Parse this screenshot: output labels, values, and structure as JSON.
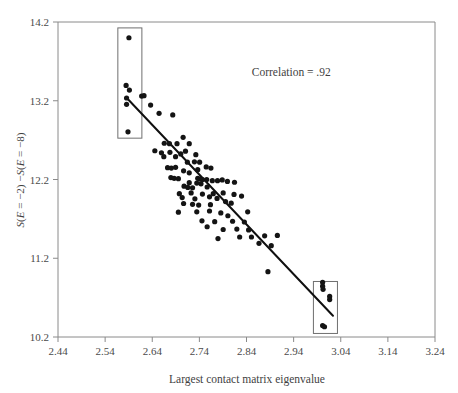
{
  "chart_data": {
    "type": "scatter",
    "title": "",
    "xlabel": "Largest contact matrix eigenvalue",
    "ylabel": "S(E = −2) −S(E = −8)",
    "ylabel_parts": {
      "p1": "S",
      "p2": "(",
      "p3": "E",
      "p4": " = −2) −",
      "p5": "S",
      "p6": "(",
      "p7": "E",
      "p8": " = −8)"
    },
    "xlim": [
      2.44,
      3.24
    ],
    "ylim": [
      10.2,
      14.2
    ],
    "xticks": [
      "2.44",
      "2.54",
      "2.64",
      "2.74",
      "2.84",
      "2.94",
      "3.04",
      "3.14",
      "3.24"
    ],
    "xtick_values": [
      2.44,
      2.54,
      2.64,
      2.74,
      2.84,
      2.94,
      3.04,
      3.14,
      3.24
    ],
    "yticks": [
      "10.2",
      "11.2",
      "12.2",
      "13.2",
      "14.2"
    ],
    "ytick_values": [
      10.2,
      11.2,
      12.2,
      13.2,
      14.2
    ],
    "grid": false,
    "legend": "none",
    "annotations": [
      {
        "name": "correlation-annotation",
        "text": "Correlation = .92",
        "x": 2.935,
        "y": 13.52
      }
    ],
    "fit_line": {
      "name": "regression-line",
      "x0": 2.5875,
      "y0": 13.225,
      "x1": 3.0235,
      "y1": 10.47
    },
    "highlight_boxes": [
      {
        "name": "left-highlight-box",
        "x0": 2.567,
        "x1": 2.618,
        "y0": 12.725,
        "y1": 14.125
      },
      {
        "name": "right-highlight-box",
        "x0": 2.982,
        "x1": 3.033,
        "y0": 10.245,
        "y1": 10.905
      }
    ],
    "points": [
      [
        2.5905,
        14.0
      ],
      [
        2.5845,
        13.395
      ],
      [
        2.5915,
        13.335
      ],
      [
        2.5855,
        13.235
      ],
      [
        2.5855,
        13.155
      ],
      [
        2.5885,
        12.805
      ],
      [
        2.6175,
        13.26
      ],
      [
        2.6225,
        13.265
      ],
      [
        2.6365,
        13.145
      ],
      [
        2.6545,
        13.04
      ],
      [
        2.6835,
        13.02
      ],
      [
        2.6455,
        12.565
      ],
      [
        2.7055,
        12.735
      ],
      [
        2.6655,
        12.66
      ],
      [
        2.6765,
        12.655
      ],
      [
        2.6925,
        12.655
      ],
      [
        2.7185,
        12.655
      ],
      [
        2.6595,
        12.54
      ],
      [
        2.6645,
        12.49
      ],
      [
        2.7005,
        12.525
      ],
      [
        2.7105,
        12.56
      ],
      [
        2.7325,
        12.515
      ],
      [
        2.6725,
        12.35
      ],
      [
        2.6805,
        12.345
      ],
      [
        2.6895,
        12.355
      ],
      [
        2.7065,
        12.31
      ],
      [
        2.7185,
        12.285
      ],
      [
        2.6795,
        12.225
      ],
      [
        2.6865,
        12.215
      ],
      [
        2.6955,
        12.21
      ],
      [
        2.7365,
        12.215
      ],
      [
        2.7415,
        12.205
      ],
      [
        2.7465,
        12.2
      ],
      [
        2.7435,
        12.145
      ],
      [
        2.7555,
        12.2
      ],
      [
        2.7675,
        12.185
      ],
      [
        2.7785,
        12.185
      ],
      [
        2.7885,
        12.195
      ],
      [
        2.7995,
        12.175
      ],
      [
        2.8145,
        12.165
      ],
      [
        2.7075,
        12.115
      ],
      [
        2.7155,
        12.1
      ],
      [
        2.7255,
        12.095
      ],
      [
        2.7565,
        12.105
      ],
      [
        2.6975,
        12.02
      ],
      [
        2.7225,
        12.03
      ],
      [
        2.7465,
        12.015
      ],
      [
        2.7615,
        11.98
      ],
      [
        2.7775,
        11.96
      ],
      [
        2.7065,
        11.895
      ],
      [
        2.7255,
        11.885
      ],
      [
        2.7385,
        11.875
      ],
      [
        2.7955,
        11.92
      ],
      [
        2.8075,
        11.9
      ],
      [
        2.6955,
        11.785
      ],
      [
        2.7345,
        11.79
      ],
      [
        2.7615,
        11.8
      ],
      [
        2.7855,
        11.775
      ],
      [
        2.8005,
        11.74
      ],
      [
        2.7455,
        11.675
      ],
      [
        2.7725,
        11.665
      ],
      [
        2.8105,
        11.67
      ],
      [
        2.8355,
        11.66
      ],
      [
        2.7565,
        11.6
      ],
      [
        2.7905,
        11.565
      ],
      [
        2.8195,
        11.57
      ],
      [
        2.8445,
        11.56
      ],
      [
        2.7795,
        11.45
      ],
      [
        2.8255,
        11.47
      ],
      [
        2.8505,
        11.47
      ],
      [
        2.8785,
        11.485
      ],
      [
        2.9055,
        11.49
      ],
      [
        2.8665,
        11.39
      ],
      [
        2.8925,
        11.36
      ],
      [
        2.8855,
        11.03
      ],
      [
        3.0015,
        10.895
      ],
      [
        3.0015,
        10.845
      ],
      [
        3.0025,
        10.805
      ],
      [
        3.0165,
        10.715
      ],
      [
        3.0165,
        10.675
      ],
      [
        3.0015,
        10.345
      ],
      [
        3.0055,
        10.33
      ],
      [
        2.7545,
        12.36
      ],
      [
        2.7645,
        12.345
      ],
      [
        2.7295,
        12.425
      ],
      [
        2.7405,
        12.42
      ],
      [
        2.6895,
        12.49
      ],
      [
        2.7695,
        12.02
      ],
      [
        2.7905,
        12.03
      ],
      [
        2.8135,
        12.01
      ],
      [
        2.8295,
        11.99
      ],
      [
        2.7145,
        12.42
      ],
      [
        2.7365,
        12.325
      ],
      [
        2.6775,
        12.545
      ],
      [
        2.7635,
        11.88
      ],
      [
        2.8425,
        11.79
      ],
      [
        2.7035,
        11.97
      ],
      [
        2.7305,
        11.955
      ],
      [
        2.7185,
        12.16
      ],
      [
        2.7345,
        12.155
      ]
    ]
  }
}
